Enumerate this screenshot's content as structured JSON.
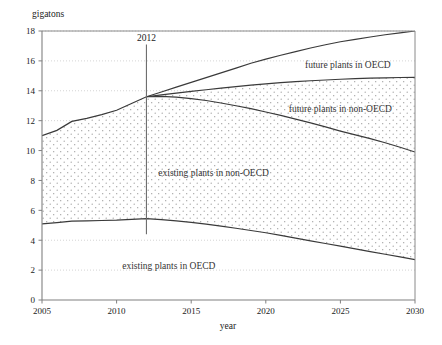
{
  "chart_data": {
    "type": "area",
    "title": "",
    "subtitle": "",
    "xlabel": "year",
    "ylabel": "gigatons",
    "xlim": [
      2005,
      2030
    ],
    "ylim": [
      0,
      18
    ],
    "grid": true,
    "legend_position": "inline-annotations",
    "x_ticks": [
      2005,
      2010,
      2015,
      2020,
      2025,
      2030
    ],
    "x_tick_labels": [
      "2005",
      "2010",
      "2015",
      "2020",
      "2025",
      "2030"
    ],
    "y_ticks": [
      0,
      2,
      4,
      6,
      8,
      10,
      12,
      14,
      16,
      18
    ],
    "y_tick_labels": [
      "0",
      "2",
      "4",
      "6",
      "8",
      "10",
      "12",
      "14",
      "16",
      "18"
    ],
    "stacked": true,
    "x": [
      2005,
      2006,
      2007,
      2008,
      2009,
      2010,
      2011,
      2012,
      2013,
      2014,
      2015,
      2016,
      2017,
      2018,
      2019,
      2020,
      2021,
      2022,
      2023,
      2024,
      2025,
      2026,
      2027,
      2028,
      2029,
      2030
    ],
    "boundaries": {
      "existing_oecd_top": [
        5.1,
        5.18,
        5.28,
        5.3,
        5.32,
        5.34,
        5.4,
        5.45,
        5.38,
        5.3,
        5.2,
        5.08,
        4.94,
        4.8,
        4.65,
        4.5,
        4.32,
        4.14,
        3.96,
        3.78,
        3.6,
        3.42,
        3.24,
        3.06,
        2.88,
        2.7
      ],
      "existing_nonoecd_top": [
        11.0,
        11.35,
        11.95,
        12.15,
        12.4,
        12.7,
        13.15,
        13.6,
        13.62,
        13.58,
        13.48,
        13.35,
        13.18,
        13.0,
        12.8,
        12.58,
        12.35,
        12.1,
        11.85,
        11.58,
        11.3,
        11.05,
        10.8,
        10.52,
        10.22,
        9.9
      ],
      "future_nonoecd_top": [
        null,
        null,
        null,
        null,
        null,
        null,
        null,
        13.6,
        13.72,
        13.84,
        13.96,
        14.07,
        14.18,
        14.28,
        14.38,
        14.46,
        14.54,
        14.61,
        14.67,
        14.72,
        14.77,
        14.81,
        14.84,
        14.87,
        14.89,
        14.9
      ],
      "future_oecd_top": [
        null,
        null,
        null,
        null,
        null,
        null,
        null,
        13.6,
        13.92,
        14.24,
        14.56,
        14.88,
        15.2,
        15.52,
        15.84,
        16.12,
        16.38,
        16.62,
        16.86,
        17.08,
        17.28,
        17.44,
        17.6,
        17.75,
        17.88,
        18.0
      ]
    },
    "series": [
      {
        "name": "existing plants in OECD",
        "fill": "none",
        "label_x": 2013.5,
        "label_y": 2.1
      },
      {
        "name": "existing plants in non-OECD",
        "fill": "stipple",
        "label_x": 2016.5,
        "label_y": 8.3
      },
      {
        "name": "future plants in non-OECD",
        "fill": "stipple",
        "label_x": 2025.0,
        "label_y": 12.6
      },
      {
        "name": "future plants in OECD",
        "fill": "none",
        "label_x": 2025.5,
        "label_y": 15.5
      }
    ],
    "annotations": [
      {
        "name": "year-marker",
        "label": "2012",
        "x": 2012,
        "y_top": 17.1,
        "y_bottom": 4.4
      }
    ],
    "colors": {
      "curve": "#3a3a3a",
      "axis": "#808080",
      "gridline": "#c9c9c9",
      "marker": "#6e6e6e",
      "stipple_dot": "#9a9a9a",
      "background": "#ffffff"
    }
  }
}
